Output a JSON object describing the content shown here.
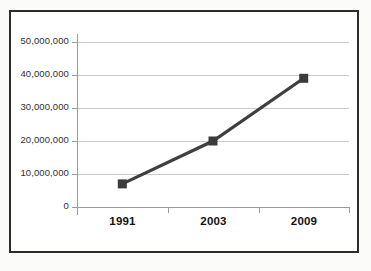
{
  "chart_data": {
    "type": "line",
    "title": "",
    "subtitle": "",
    "xlabel": "",
    "ylabel": "",
    "categories": [
      "1991",
      "2003",
      "2009"
    ],
    "x": [
      "1991",
      "2003",
      "2009"
    ],
    "values": [
      7000000,
      20000000,
      39000000
    ],
    "series": [
      {
        "name": "",
        "values": [
          7000000,
          20000000,
          39000000
        ]
      }
    ],
    "ylim": [
      0,
      50000000
    ],
    "y_ticks": [
      0,
      10000000,
      20000000,
      30000000,
      40000000,
      50000000
    ],
    "y_tick_labels": [
      "0",
      "10,000,000",
      "20,000,000",
      "30,000,000",
      "40,000,000",
      "50,000,000"
    ],
    "x_tick_labels": [
      "1991",
      "2003",
      "2009"
    ],
    "grid": true,
    "grid_axis": "y",
    "legend": false,
    "legend_position": "none",
    "marker": "square",
    "annotations": []
  },
  "style": {
    "line_color": "#3f3f3f",
    "marker_color": "#3b3b3b",
    "grid_color": "#c9c9c9",
    "axis_color": "#9b9b9b",
    "frame_color": "#2c2c2c",
    "label_color": "#2f2f2f",
    "category_label_color": "#111111",
    "plot_background": "#ffffff",
    "page_background": "#fbfbfa"
  },
  "icons": {
    "marker": "square-marker-icon"
  }
}
